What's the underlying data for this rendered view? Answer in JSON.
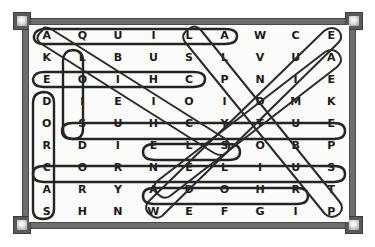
{
  "puzzle": {
    "title": "Word search puzzle",
    "rows": 9,
    "cols": 9,
    "grid": [
      [
        "A",
        "Q",
        "U",
        "I",
        "L",
        "A",
        "W",
        "C",
        "E"
      ],
      [
        "K",
        "L",
        "B",
        "U",
        "S",
        "L",
        "V",
        "U",
        "A"
      ],
      [
        "E",
        "O",
        "I",
        "H",
        "C",
        "P",
        "N",
        "I",
        "E"
      ],
      [
        "D",
        "I",
        "E",
        "I",
        "O",
        "I",
        "D",
        "M",
        "K"
      ],
      [
        "O",
        "S",
        "U",
        "H",
        "C",
        "Y",
        "T",
        "U",
        "E"
      ],
      [
        "R",
        "D",
        "I",
        "E",
        "L",
        "S",
        "O",
        "B",
        "P"
      ],
      [
        "C",
        "O",
        "R",
        "N",
        "E",
        "L",
        "I",
        "U",
        "S"
      ],
      [
        "A",
        "R",
        "Y",
        "A",
        "D",
        "O",
        "H",
        "R",
        "T"
      ],
      [
        "S",
        "H",
        "N",
        "W",
        "E",
        "F",
        "G",
        "I",
        "P"
      ]
    ],
    "found_words": [
      {
        "word": "AQUILA",
        "direction": "horizontal",
        "start_row": 1,
        "start_col": 1,
        "end_row": 1,
        "end_col": 6
      },
      {
        "word": "LOIS",
        "direction": "vertical",
        "start_row": 2,
        "start_col": 2,
        "end_row": 5,
        "end_col": 2
      },
      {
        "word": "EOIHC",
        "direction": "horizontal",
        "start_row": 3,
        "start_col": 1,
        "end_row": 3,
        "end_col": 5
      },
      {
        "word": "DORCAS",
        "direction": "vertical",
        "start_row": 4,
        "start_col": 1,
        "end_row": 9,
        "end_col": 1
      },
      {
        "word": "SUHCYTUE",
        "direction": "horizontal",
        "start_row": 5,
        "start_col": 2,
        "end_row": 5,
        "end_col": 9
      },
      {
        "word": "ELSOB",
        "direction": "horizontal",
        "start_row": 6,
        "start_col": 4,
        "end_row": 6,
        "end_col": 6
      },
      {
        "word": "CORNELIUS",
        "direction": "horizontal",
        "start_row": 7,
        "start_col": 1,
        "end_row": 7,
        "end_col": 9
      },
      {
        "word": "ADOHR",
        "direction": "horizontal",
        "start_row": 8,
        "start_col": 4,
        "end_row": 8,
        "end_col": 8
      },
      {
        "word": "ACIDIC",
        "direction": "diagonal-down-right",
        "start_row": 1,
        "start_col": 1,
        "end_row": 6,
        "end_col": 6
      },
      {
        "word": "EVANGELIST",
        "direction": "diagonal-down-right",
        "start_row": 1,
        "start_col": 5,
        "end_row": 9,
        "end_col": 9
      },
      {
        "word": "ESCAPE",
        "direction": "diagonal-up-right",
        "start_row": 9,
        "start_col": 4,
        "end_row": 1,
        "end_col": 9
      },
      {
        "word": "PRIMUS",
        "direction": "diagonal-up-right",
        "start_row": 8,
        "start_col": 4,
        "end_row": 2,
        "end_col": 9
      }
    ]
  },
  "colors": {
    "frame": "#6e6e6e",
    "stud": "#5a5a5a",
    "paper": "#fbfbf9",
    "letter": "#1a1a1a",
    "marker": "#242424"
  }
}
